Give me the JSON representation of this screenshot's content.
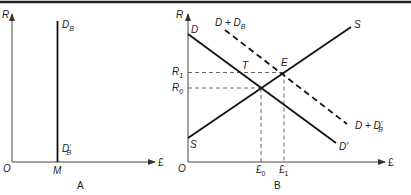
{
  "panel_a": {
    "caption": "A",
    "y_axis_label": "R",
    "x_axis_label": "£",
    "origin_label": "O",
    "quantity_label": "M",
    "curve_top_label": {
      "base": "D",
      "sub": "B"
    },
    "curve_bottom_label": {
      "base": "D",
      "sup": "′",
      "sub": "B"
    }
  },
  "panel_b": {
    "caption": "B",
    "y_axis_label": "R",
    "x_axis_label": "£",
    "origin_label": "O",
    "demand_label": "D",
    "demand_end_label": "D′",
    "supply_label_bottom": "S",
    "supply_label_top": "S",
    "shifted_demand_label": {
      "base": "D + D",
      "sub": "B"
    },
    "shifted_demand_end_label": {
      "base": "D + D",
      "sup": "′",
      "sub": "B"
    },
    "point_t": "T",
    "point_e": "E",
    "r1": {
      "base": "R",
      "sub": "1"
    },
    "r0": {
      "base": "R",
      "sub": "0"
    },
    "q0": {
      "base": "£",
      "sub": "0"
    },
    "q1": {
      "base": "£",
      "sub": "1"
    }
  }
}
